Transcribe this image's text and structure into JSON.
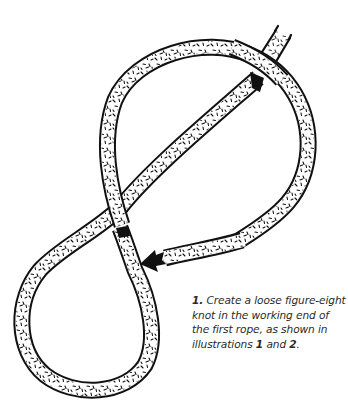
{
  "figure": {
    "colors": {
      "ink": "#111111",
      "paper": "#ffffff",
      "text": "#2a2a2a"
    }
  },
  "caption": {
    "step_number": "1.",
    "text_part1": " Create a loose figure-eight knot in the working end of the first rope, as shown in illustrations ",
    "ref1": "1",
    "text_part2": " and ",
    "ref2": "2",
    "text_end": "."
  }
}
